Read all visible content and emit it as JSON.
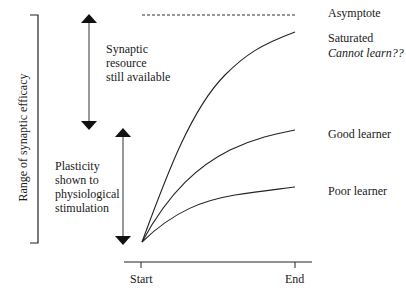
{
  "diagram": {
    "y_axis_label": "Range of synaptic efficacy",
    "x_axis": {
      "start_label": "Start",
      "end_label": "End"
    },
    "asymptote_label": "Asymptote",
    "curves": [
      {
        "name": "Saturated",
        "label_line1": "Saturated",
        "label_line2": "Cannot learn??"
      },
      {
        "name": "Good learner",
        "label": "Good learner"
      },
      {
        "name": "Poor learner",
        "label": "Poor learner"
      }
    ],
    "upper_range_label": [
      "Synaptic",
      "resource",
      "still available"
    ],
    "lower_range_label": [
      "Plasticity",
      "shown to",
      "physiological",
      "stimulation"
    ]
  },
  "colors": {
    "line": "#1a1a1a",
    "background": "#ffffff"
  }
}
